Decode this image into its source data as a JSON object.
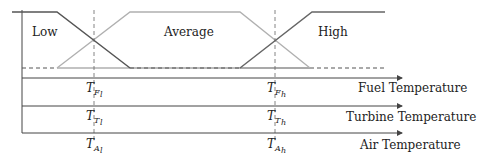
{
  "diagram": {
    "membership_sets": [
      {
        "name": "Low",
        "color": "#555555"
      },
      {
        "name": "Average",
        "color": "#b0b0b0"
      },
      {
        "name": "High",
        "color": "#555555"
      }
    ],
    "axes": [
      {
        "label": "Fuel Temperature",
        "thresholds": [
          {
            "base": "T",
            "sub": "F",
            "subsub": "l"
          },
          {
            "base": "T",
            "sub": "F",
            "subsub": "h"
          }
        ]
      },
      {
        "label": "Turbine Temperature",
        "thresholds": [
          {
            "base": "T",
            "sub": "T",
            "subsub": "l"
          },
          {
            "base": "T",
            "sub": "T",
            "subsub": "h"
          }
        ]
      },
      {
        "label": "Air Temperature",
        "thresholds": [
          {
            "base": "T",
            "sub": "A",
            "subsub": "l"
          },
          {
            "base": "T",
            "sub": "A",
            "subsub": "h"
          }
        ]
      }
    ],
    "colors": {
      "dark_line": "#555555",
      "light_line": "#b0b0b0",
      "axis": "#444444"
    }
  }
}
